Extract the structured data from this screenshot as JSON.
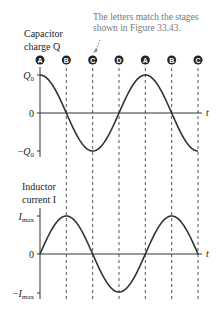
{
  "annotation": [
    "The letters match the stages",
    "shown in Figure 33.43."
  ],
  "stage_markers": [
    "A",
    "B",
    "C",
    "D",
    "A",
    "B",
    "C"
  ],
  "chart_data": [
    {
      "type": "line",
      "title": [
        "Capacitor",
        "charge Q"
      ],
      "xlabel": "t",
      "ylabel": "Q",
      "yticks": [
        "Q0",
        "0",
        "-Q0"
      ],
      "ylim": [
        -1,
        1
      ],
      "x_cycles": 1.5,
      "function": "cos",
      "x": [
        0,
        0.25,
        0.5,
        0.75,
        1.0,
        1.25,
        1.5
      ],
      "y": [
        1,
        0,
        -1,
        0,
        1,
        0,
        -1
      ]
    },
    {
      "type": "line",
      "title": [
        "Inductor",
        "current I"
      ],
      "xlabel": "t",
      "ylabel": "I",
      "yticks": [
        "Imax",
        "0",
        "-Imax"
      ],
      "ylim": [
        -1,
        1
      ],
      "x_cycles": 1.5,
      "function": "sin",
      "x": [
        0,
        0.25,
        0.5,
        0.75,
        1.0,
        1.25,
        1.5
      ],
      "y": [
        0,
        1,
        0,
        -1,
        0,
        1,
        0
      ]
    }
  ]
}
